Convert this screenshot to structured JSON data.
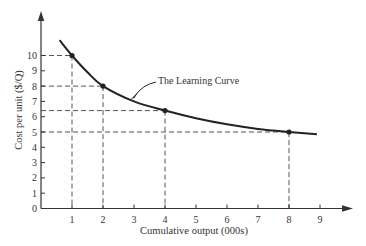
{
  "chart_data": {
    "type": "line",
    "title": "",
    "xlabel": "Cumulative output (000s)",
    "ylabel": "Cost per unit ($/Q)",
    "xlim": [
      0,
      9.9
    ],
    "ylim": [
      0,
      11.5
    ],
    "x_ticks": [
      "1",
      "2",
      "3",
      "4",
      "5",
      "6",
      "7",
      "8",
      "9"
    ],
    "y_ticks": [
      "0",
      "1",
      "2",
      "3",
      "4",
      "5",
      "6",
      "7",
      "8",
      "9",
      "10"
    ],
    "grid": false,
    "legend": null,
    "series": [
      {
        "name": "The Learning Curve",
        "curve": {
          "x": [
            0.6,
            1,
            1.5,
            2,
            3,
            4,
            5,
            6,
            7,
            8,
            8.9
          ],
          "y": [
            11.0,
            10.0,
            8.9,
            8.0,
            7.0,
            6.4,
            5.9,
            5.5,
            5.2,
            5.0,
            4.85
          ]
        },
        "marked_points": {
          "x": [
            1,
            2,
            4,
            8
          ],
          "y": [
            10,
            8,
            6.4,
            5
          ]
        }
      }
    ],
    "annotations": [
      {
        "text": "The Learning Curve",
        "points_to": {
          "x": 2.9,
          "y": 7.15
        }
      }
    ],
    "reference_lines": "dashed projections from each marked point to both axes"
  },
  "labels": {
    "xlabel": "Cumulative output (000s)",
    "ylabel": "Cost per unit ($/Q)",
    "annotation": "The Learning Curve"
  }
}
